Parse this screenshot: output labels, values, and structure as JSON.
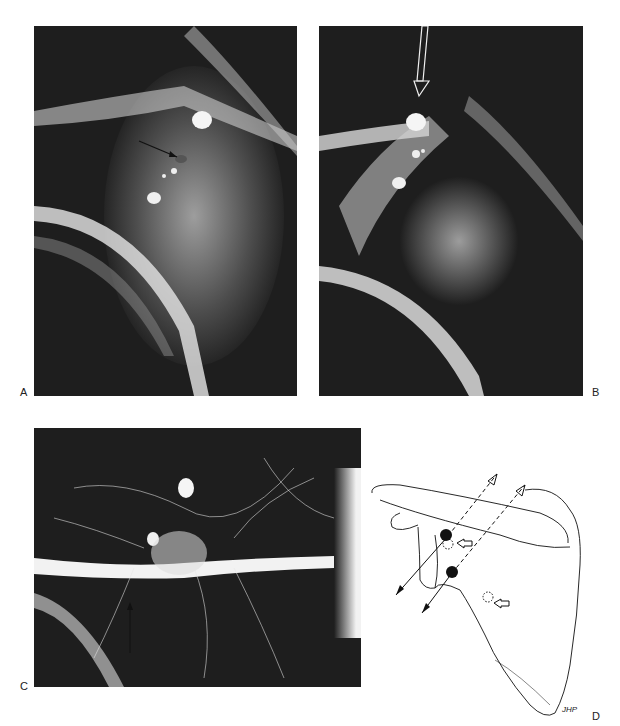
{
  "figure": {
    "panels": [
      {
        "id": "A",
        "label": "A",
        "type": "radiograph",
        "annotation": "black arrow pointing to lesion near radiopaque markers"
      },
      {
        "id": "B",
        "label": "B",
        "type": "radiograph",
        "annotation": "white hollow arrow pointing down to radiopaque marker"
      },
      {
        "id": "C",
        "label": "C",
        "type": "angiogram",
        "annotation": "thin black arrow pointing up to vessel"
      },
      {
        "id": "D",
        "label": "D",
        "type": "line-drawing",
        "annotation": "scapula diagram with two trajectory lines, two solid dots and two hollow open arrows",
        "signature": "JHP"
      }
    ]
  },
  "colors": {
    "background": "#ffffff",
    "film_dark": "#1e1e1e",
    "bone_light": "#e8e8e8",
    "ink": "#111111"
  }
}
